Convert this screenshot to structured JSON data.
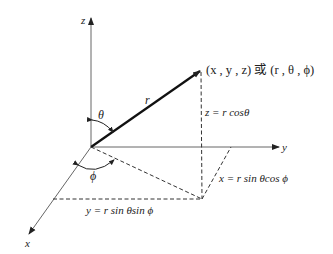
{
  "diagram": {
    "axes": {
      "x_label": "x",
      "y_label": "y",
      "z_label": "z"
    },
    "vector_label": "r",
    "angles": {
      "polar": "θ",
      "azimuth": "ϕ"
    },
    "point_label": "(x , y , z) 或 (r , θ , ϕ)",
    "equations": {
      "z": "z = r cosθ",
      "x": "x = r sin θcos ϕ",
      "y": "y = r sin θsin ϕ"
    },
    "colors": {
      "line": "#222222",
      "axis": "#555555",
      "background": "#ffffff"
    }
  }
}
